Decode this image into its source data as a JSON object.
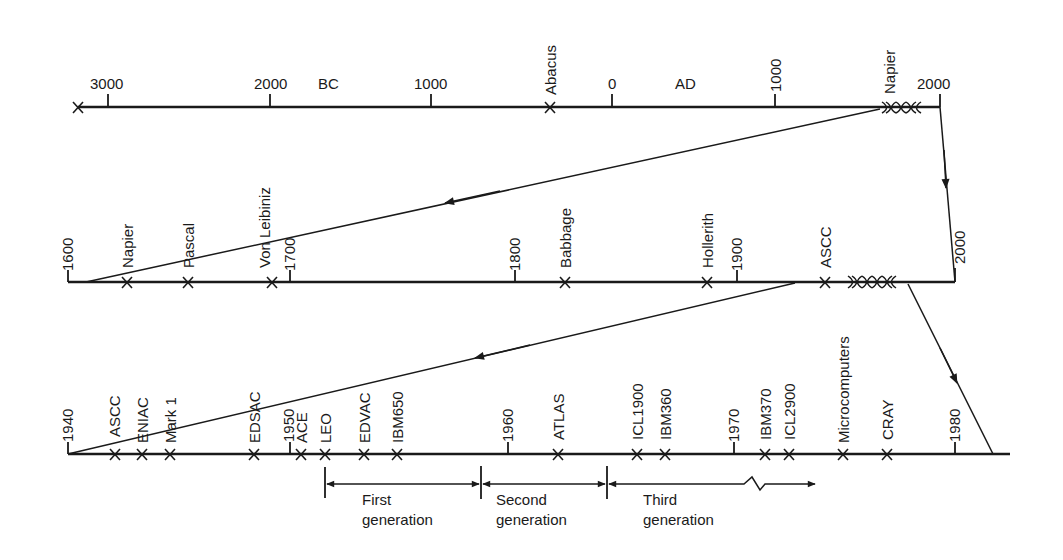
{
  "figure": {
    "type": "timeline"
  },
  "top_timeline": {
    "era_labels": {
      "bc": "BC",
      "ad": "AD"
    },
    "ticks": [
      {
        "label": "3000",
        "era": "BC"
      },
      {
        "label": "2000",
        "era": "BC"
      },
      {
        "label": "1000",
        "era": "BC"
      },
      {
        "label": "0",
        "era": ""
      },
      {
        "label": "1000",
        "era": "AD"
      },
      {
        "label": "2000",
        "era": "AD"
      }
    ],
    "events": [
      {
        "label": "Abacus"
      },
      {
        "label": "Napier"
      }
    ]
  },
  "middle_timeline": {
    "ticks": [
      "1600",
      "1700",
      "1800",
      "1900",
      "2000"
    ],
    "events": [
      {
        "label": "Napier"
      },
      {
        "label": "Pascal"
      },
      {
        "label": "Von Leibiniz"
      },
      {
        "label": "Babbage"
      },
      {
        "label": "Hollerith"
      },
      {
        "label": "ASCC"
      }
    ]
  },
  "bottom_timeline": {
    "ticks": [
      "1940",
      "1950",
      "1960",
      "1970",
      "1980"
    ],
    "events": [
      {
        "label": "ASCC"
      },
      {
        "label": "ENIAC"
      },
      {
        "label": "Mark 1"
      },
      {
        "label": "EDSAC"
      },
      {
        "label": "ACE"
      },
      {
        "label": "LEO"
      },
      {
        "label": "EDVAC"
      },
      {
        "label": "IBM650"
      },
      {
        "label": "ATLAS"
      },
      {
        "label": "ICL1900"
      },
      {
        "label": "IBM360"
      },
      {
        "label": "IBM370"
      },
      {
        "label": "ICL2900"
      },
      {
        "label": "Microcomputers"
      },
      {
        "label": "CRAY"
      }
    ]
  },
  "generations": [
    {
      "line1": "First",
      "line2": "generation"
    },
    {
      "line1": "Second",
      "line2": "generation"
    },
    {
      "line1": "Third",
      "line2": "generation"
    }
  ],
  "colors": {
    "ink": "#1a1a1a",
    "background": "#ffffff"
  }
}
